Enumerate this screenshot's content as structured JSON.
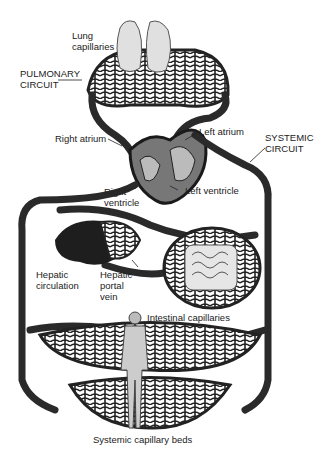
{
  "diagram": {
    "labels": {
      "lung_capillaries": "Lung\ncapillaries",
      "pulmonary_circuit": "PULMONARY\nCIRCUIT",
      "right_atrium": "Right atrium",
      "left_atrium": "Left atrium",
      "systemic_circuit": "SYSTEMIC\nCIRCUIT",
      "right_ventricle": "Right\nventricle",
      "left_ventricle": "Left ventricle",
      "hepatic_circulation": "Hepatic\ncirculation",
      "hepatic_portal_vein": "Hepatic\nportal\nvein",
      "intestinal_capillaries": "Intestinal capillaries",
      "systemic_capillary_beds": "Systemic capillary beds"
    },
    "colors": {
      "vessel": "#2a2a2a",
      "vessel_highlight": "#9a9a9a",
      "organ": "#d8d8d8",
      "liver": "#1e1e1e",
      "background": "#ffffff"
    }
  }
}
